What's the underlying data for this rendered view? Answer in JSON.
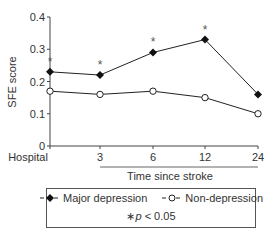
{
  "chart_data": {
    "type": "line",
    "title": "",
    "xlabel": "Time since stroke",
    "ylabel": "SFE score",
    "ylim": [
      0,
      0.4
    ],
    "yticks": [
      "0",
      "0.1",
      "0.2",
      "0.3",
      "0.4"
    ],
    "categories": [
      "Hospital",
      "3",
      "6",
      "12",
      "24"
    ],
    "grid": false,
    "legend_position": "bottom",
    "series": [
      {
        "name": "Major depression",
        "marker": "filled-diamond",
        "values": [
          0.23,
          0.22,
          0.29,
          0.33,
          0.16
        ],
        "significant": [
          true,
          true,
          true,
          true,
          false
        ]
      },
      {
        "name": "Non-depression",
        "marker": "open-circle",
        "values": [
          0.17,
          0.16,
          0.17,
          0.15,
          0.1
        ]
      }
    ],
    "annotations": [
      "*p < 0.05"
    ],
    "significance_marker": "*"
  },
  "legend": {
    "major_label": "Major depression",
    "non_label": "Non-depression",
    "note_star": "∗",
    "note_p": "p",
    "note_rest": " < 0.05"
  }
}
